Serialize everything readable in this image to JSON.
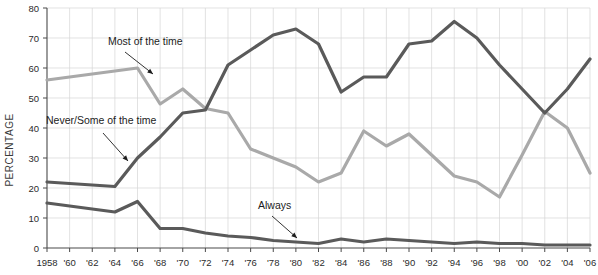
{
  "chart_data": {
    "type": "line",
    "title": "",
    "xlabel": "",
    "ylabel": "PERCENTAGE",
    "ylim": [
      0,
      80
    ],
    "ytick_values": [
      0,
      10,
      20,
      30,
      40,
      50,
      60,
      70,
      80
    ],
    "ytick_labels": [
      "0",
      "10",
      "20",
      "30",
      "40",
      "50",
      "60",
      "70",
      "80"
    ],
    "grid": true,
    "legend_position": "inline-annotations",
    "x": [
      1958,
      1960,
      1962,
      1964,
      1966,
      1968,
      1970,
      1972,
      1974,
      1976,
      1978,
      1980,
      1982,
      1984,
      1986,
      1988,
      1990,
      1992,
      1994,
      1996,
      1998,
      2000,
      2002,
      2004,
      2006
    ],
    "xtick_labels": [
      "1958",
      "'60",
      "'62",
      "'64",
      "'66",
      "'68",
      "'70",
      "'72",
      "'74",
      "'76",
      "'78",
      "'80",
      "'82",
      "'84",
      "'86",
      "'88",
      "'90",
      "'92",
      "'94",
      "'96",
      "'98",
      "'00",
      "'02",
      "'04",
      "'06"
    ],
    "series": [
      {
        "name": "Never/Some of the time",
        "color": "#5a5a5a",
        "values": [
          22,
          21.5,
          21,
          20.5,
          30,
          37,
          45,
          46,
          61,
          66,
          71,
          73,
          68,
          52,
          57,
          57,
          68,
          69,
          75.5,
          70,
          61,
          53,
          45,
          53,
          63
        ]
      },
      {
        "name": "Most of the time",
        "color": "#a9a9a9",
        "values": [
          56,
          57,
          58,
          59,
          60,
          48,
          53,
          46.5,
          45,
          33,
          30,
          27,
          22,
          25,
          39,
          34,
          38,
          31,
          24,
          22,
          17,
          31,
          45.5,
          40,
          25
        ]
      },
      {
        "name": "Always",
        "color": "#5a5a5a",
        "values": [
          15,
          14,
          13,
          12,
          15.5,
          6.5,
          6.5,
          5,
          4,
          3.5,
          2.5,
          2,
          1.5,
          3,
          2,
          3,
          2.5,
          2,
          1.5,
          2,
          1.5,
          1.5,
          1,
          1,
          1
        ]
      }
    ],
    "annotations": [
      {
        "label": "Most of the time",
        "pointer": "arrow-down-left"
      },
      {
        "label": "Never/Some of the time",
        "pointer": "arrow-down-right"
      },
      {
        "label": "Always",
        "pointer": "arrow-down-right"
      }
    ]
  }
}
